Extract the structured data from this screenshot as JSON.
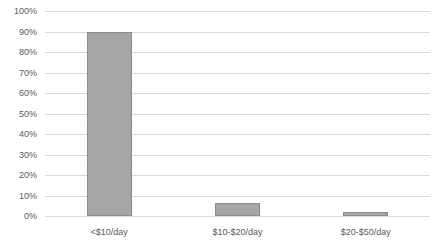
{
  "chart_data": {
    "type": "bar",
    "title": "",
    "subtitle": "",
    "xlabel": "",
    "ylabel": "",
    "categories": [
      "<$10/day",
      "$10-$20/day",
      "$20-$50/day"
    ],
    "values": [
      90,
      6.5,
      2
    ],
    "value_unit": "%",
    "ylim": [
      0,
      100
    ],
    "y_ticks": [
      0,
      10,
      20,
      30,
      40,
      50,
      60,
      70,
      80,
      90,
      100
    ],
    "y_tick_labels": [
      "0%",
      "10%",
      "20%",
      "30%",
      "40%",
      "50%",
      "60%",
      "70%",
      "80%",
      "90%",
      "100%"
    ],
    "grid": "horizontal",
    "legend": "none",
    "legend_entries": [],
    "annotations": [],
    "colors": {
      "bar_fill": "#a6a6a6",
      "bar_border": "#8c8c8c",
      "gridline": "#d9d9d9",
      "tick_label": "#595959",
      "background": "#ffffff"
    }
  }
}
